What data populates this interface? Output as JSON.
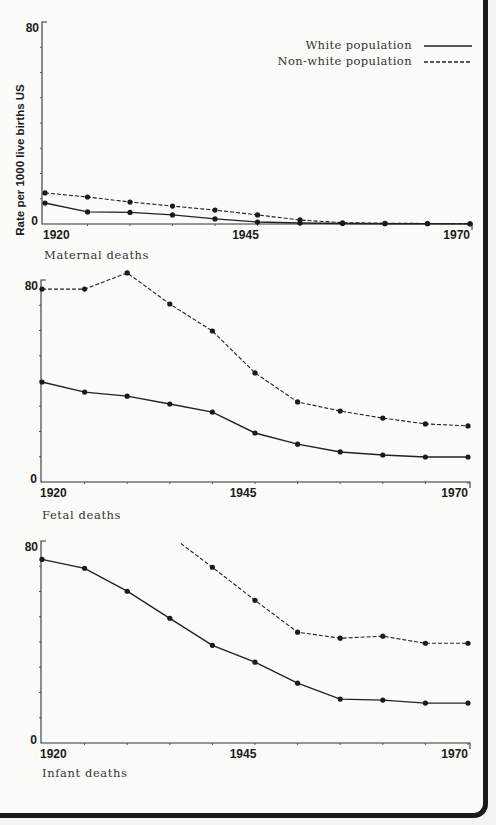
{
  "legend": {
    "white_label": "White population",
    "nonwhite_label": "Non-white population"
  },
  "y_axis_label": "Rate per 1000 live births US",
  "chart_data": [
    {
      "type": "line",
      "title": "Maternal deaths",
      "xlabel": "",
      "ylabel": "Rate per 1000 live births US",
      "x": [
        1920,
        1925,
        1930,
        1935,
        1940,
        1945,
        1950,
        1955,
        1960,
        1965,
        1970
      ],
      "x_tick_labels": [
        "1920",
        "1945",
        "1970"
      ],
      "y_tick_labels": [
        "0",
        "80"
      ],
      "ylim": [
        0,
        80
      ],
      "series": [
        {
          "name": "White population",
          "style": "solid",
          "values": [
            8.3,
            4.8,
            4.6,
            3.6,
            2.0,
            0.8,
            0.4,
            0.2,
            0.1,
            0.1,
            0.05
          ]
        },
        {
          "name": "Non-white population",
          "style": "dashed",
          "values": [
            12.3,
            10.7,
            8.7,
            7.1,
            5.5,
            3.6,
            1.6,
            0.5,
            0.3,
            0.2,
            0.1
          ]
        }
      ]
    },
    {
      "type": "line",
      "title": "Fetal deaths",
      "xlabel": "",
      "ylabel": "Rate per 1000 live births US",
      "x": [
        1920,
        1925,
        1930,
        1935,
        1940,
        1945,
        1950,
        1955,
        1960,
        1965,
        1970
      ],
      "x_tick_labels": [
        "1920",
        "1945",
        "1970"
      ],
      "y_tick_labels": [
        "0",
        "80"
      ],
      "ylim": [
        0,
        80
      ],
      "series": [
        {
          "name": "White population",
          "style": "solid",
          "values": [
            39.6,
            35.6,
            34.0,
            30.9,
            27.7,
            19.4,
            15.0,
            11.9,
            10.7,
            9.9,
            9.9
          ]
        },
        {
          "name": "Non-white population",
          "style": "dashed",
          "values": [
            76.4,
            76.4,
            82.8,
            70.5,
            59.8,
            43.2,
            31.7,
            28.1,
            25.3,
            23.0,
            22.2
          ]
        }
      ]
    },
    {
      "type": "line",
      "title": "Infant deaths",
      "xlabel": "",
      "ylabel": "Rate per 1000 live births US",
      "x": [
        1920,
        1925,
        1930,
        1935,
        1940,
        1945,
        1950,
        1955,
        1960,
        1965,
        1970
      ],
      "x_tick_labels": [
        "1920",
        "1945",
        "1970"
      ],
      "y_tick_labels": [
        "0",
        "80"
      ],
      "ylim": [
        0,
        80
      ],
      "series": [
        {
          "name": "White population",
          "style": "solid",
          "values": [
            72.7,
            69.2,
            60.1,
            49.4,
            38.7,
            32.0,
            23.7,
            17.4,
            17.0,
            15.8,
            15.8
          ]
        },
        {
          "name": "Non-white population",
          "style": "dashed",
          "line_start": {
            "x": 1936.3,
            "value": 79.0
          },
          "values": [
            null,
            null,
            null,
            null,
            69.6,
            56.5,
            43.9,
            41.5,
            42.3,
            39.5,
            39.5
          ]
        }
      ]
    }
  ]
}
